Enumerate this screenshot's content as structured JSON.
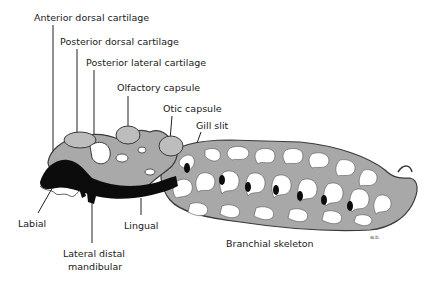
{
  "figure": {
    "labels": [
      {
        "id": "anterior-dorsal-cartilage",
        "text": "Anterior dorsal cartilage",
        "x": 34,
        "y": 12
      },
      {
        "id": "posterior-dorsal-cartilage",
        "text": "Posterior dorsal cartilage",
        "x": 60,
        "y": 36
      },
      {
        "id": "posterior-lateral-cartilage",
        "text": "Posterior lateral cartilage",
        "x": 86,
        "y": 57
      },
      {
        "id": "olfactory-capsule",
        "text": "Olfactory capsule",
        "x": 117,
        "y": 82
      },
      {
        "id": "otic-capsule",
        "text": "Otic capsule",
        "x": 163,
        "y": 103
      },
      {
        "id": "gill-slit",
        "text": "Gill slit",
        "x": 196,
        "y": 120
      },
      {
        "id": "labial",
        "text": "Labial",
        "x": 18,
        "y": 218
      },
      {
        "id": "lingual",
        "text": "Lingual",
        "x": 124,
        "y": 220
      },
      {
        "id": "lateral-distal-mandibular-line1",
        "text": "Lateral distal",
        "x": 63,
        "y": 248
      },
      {
        "id": "lateral-distal-mandibular-line2",
        "text": "mandibular",
        "x": 68,
        "y": 261
      },
      {
        "id": "branchial-skeleton",
        "text": "Branchial skeleton",
        "x": 226,
        "y": 238
      }
    ],
    "signature": "w.b.",
    "colors": {
      "cartilage_fill": "#a9a9a9",
      "cartilage_light": "#bdbdbd",
      "outline": "#3a3a3a",
      "dark_structure": "#0c0c0c",
      "background": "#ffffff"
    }
  }
}
